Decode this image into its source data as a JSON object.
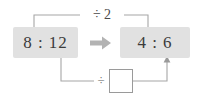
{
  "diagram": {
    "type": "ratio-simplification",
    "background_color": "#ffffff",
    "box_fill_color": "#e1e1e1",
    "line_color": "#9a9a9a",
    "text_color": "#3b3b3b",
    "left_box": {
      "label": "8 : 12",
      "antecedent": "8",
      "separator": ":",
      "consequent": "12"
    },
    "right_box": {
      "label": "4 : 6",
      "antecedent": "4",
      "separator": ":",
      "consequent": "6"
    },
    "transform_arrow": {
      "icon": "right-arrow-icon",
      "direction": "right"
    },
    "top_operation": {
      "label": "÷ 2",
      "operator": "÷",
      "operand": "2",
      "applies_to": "antecedent"
    },
    "bottom_operation": {
      "label": "÷",
      "operator": "÷",
      "operand": "",
      "applies_to": "consequent",
      "answer_placeholder": ""
    }
  }
}
